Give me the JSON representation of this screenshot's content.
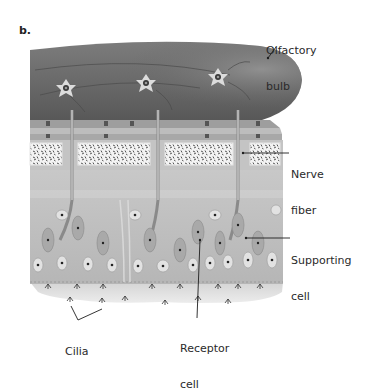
{
  "figure": {
    "panel_label": "b.",
    "colors": {
      "bulb": "#6e6e6e",
      "bulb_highlight": "#8a8a8a",
      "plate": "#b9b9b9",
      "bone_box": "#f2f2f2",
      "tissue": "#bdbdbd",
      "tissue_light": "#cfcfcf",
      "mucus": "#e2e2e2",
      "line": "#1e1e1e",
      "text": "#2a2a2a"
    },
    "labels": [
      {
        "id": "olfactory-bulb",
        "line1": "Olfactory",
        "line2": "bulb"
      },
      {
        "id": "nerve-fiber",
        "line1": "Nerve",
        "line2": "fiber"
      },
      {
        "id": "supporting-cell",
        "line1": "Supporting",
        "line2": "cell"
      },
      {
        "id": "cilia",
        "line1": "Cilia",
        "line2": ""
      },
      {
        "id": "receptor-cell",
        "line1": "Receptor",
        "line2": "cell"
      }
    ]
  }
}
